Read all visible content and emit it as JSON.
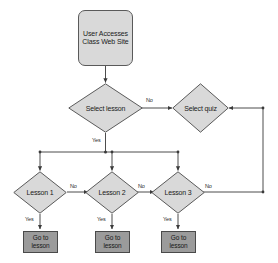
{
  "page": {
    "title_fragment": "",
    "background_color": "#ffffff"
  },
  "palette": {
    "node_fill_light": "#d9d9d9",
    "node_fill_dark": "#9b9b9b",
    "node_stroke": "#5a5a5a",
    "line_color": "#4d4d4d",
    "text_color": "#1a1a1a"
  },
  "diagram": {
    "type": "flowchart",
    "nodes": {
      "start": {
        "label": "User Accesses Class Web Site",
        "shape": "rounded-rectangle"
      },
      "select_lesson": {
        "label": "Select lesson",
        "shape": "diamond"
      },
      "select_quiz": {
        "label": "Select quiz",
        "shape": "diamond"
      },
      "lesson1": {
        "label": "Lesson 1",
        "shape": "diamond"
      },
      "lesson2": {
        "label": "Lesson 2",
        "shape": "diamond"
      },
      "lesson3": {
        "label": "Lesson 3",
        "shape": "diamond"
      },
      "goto1": {
        "label": "Go to lesson",
        "shape": "rectangle"
      },
      "goto2": {
        "label": "Go to lesson",
        "shape": "rectangle"
      },
      "goto3": {
        "label": "Go to lesson",
        "shape": "rectangle"
      }
    },
    "edge_labels": {
      "select_lesson_no": "No",
      "select_lesson_yes": "Yes",
      "lesson1_no": "No",
      "lesson1_yes": "Yes",
      "lesson2_no": "No",
      "lesson2_yes": "Yes",
      "lesson3_no": "No",
      "lesson3_yes": "Yes"
    },
    "edges": [
      {
        "from": "start",
        "to": "select_lesson",
        "label": ""
      },
      {
        "from": "select_lesson",
        "to": "select_quiz",
        "label": "No"
      },
      {
        "from": "select_lesson",
        "to": "lesson1",
        "label": "Yes"
      },
      {
        "from": "select_lesson",
        "to": "lesson2",
        "label": "Yes"
      },
      {
        "from": "select_lesson",
        "to": "lesson3",
        "label": "Yes"
      },
      {
        "from": "lesson1",
        "to": "lesson2",
        "label": "No"
      },
      {
        "from": "lesson2",
        "to": "lesson3",
        "label": "No"
      },
      {
        "from": "lesson3",
        "to": "select_quiz",
        "label": "No"
      },
      {
        "from": "lesson1",
        "to": "goto1",
        "label": "Yes"
      },
      {
        "from": "lesson2",
        "to": "goto2",
        "label": "Yes"
      },
      {
        "from": "lesson3",
        "to": "goto3",
        "label": "Yes"
      }
    ]
  }
}
